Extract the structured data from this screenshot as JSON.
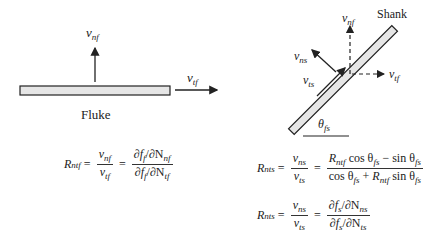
{
  "left_panel": {
    "title": "Fluke",
    "vectors": {
      "normal": {
        "symbol": "v",
        "sub": "nf"
      },
      "tangential": {
        "symbol": "v",
        "sub": "tf"
      }
    },
    "equation": {
      "lhs": {
        "symbol": "R",
        "sub": "ntf"
      },
      "frac1": {
        "num_symbol": "v",
        "num_sub": "nf",
        "den_symbol": "v",
        "den_sub": "tf"
      },
      "frac2": {
        "num": "∂f",
        "num_fsub": "f",
        "num_rest": "/∂N",
        "num_nsub": "nf",
        "den": "∂f",
        "den_fsub": "f",
        "den_rest": "/∂N",
        "den_nsub": "tf"
      }
    }
  },
  "right_panel": {
    "title": "Shank",
    "angle_label": {
      "symbol": "θ",
      "sub": "fs"
    },
    "vectors": {
      "fluke_normal": {
        "symbol": "v",
        "sub": "nf"
      },
      "fluke_tangential": {
        "symbol": "v",
        "sub": "tf"
      },
      "shank_normal": {
        "symbol": "v",
        "sub": "ns"
      },
      "shank_tangential": {
        "symbol": "v",
        "sub": "ts"
      }
    },
    "equation1": {
      "lhs": {
        "symbol": "R",
        "sub": "nts"
      },
      "frac1": {
        "num_symbol": "v",
        "num_sub": "ns",
        "den_symbol": "v",
        "den_sub": "ts"
      },
      "frac2": {
        "num": {
          "r": "R",
          "r_sub": "ntf",
          "t1": " cos θ",
          "t1_sub": "fs",
          "op": " − sin θ",
          "op_sub": "fs"
        },
        "den": {
          "t1": "cos θ",
          "t1_sub": "fs",
          "op": " + ",
          "r": "R",
          "r_sub": "ntf",
          "t2": " sin θ",
          "t2_sub": "fs"
        }
      }
    },
    "equation2": {
      "lhs": {
        "symbol": "R",
        "sub": "nts"
      },
      "frac1": {
        "num_symbol": "v",
        "num_sub": "ns",
        "den_symbol": "v",
        "den_sub": "ts"
      },
      "frac2": {
        "num": "∂f",
        "num_fsub": "s",
        "num_rest": "/∂N",
        "num_nsub": "ns",
        "den": "∂f",
        "den_fsub": "s",
        "den_rest": "/∂N",
        "den_nsub": "ts"
      }
    }
  },
  "colors": {
    "stroke": "#222222",
    "bar_fill": "#e6e6e6"
  },
  "equals": "="
}
